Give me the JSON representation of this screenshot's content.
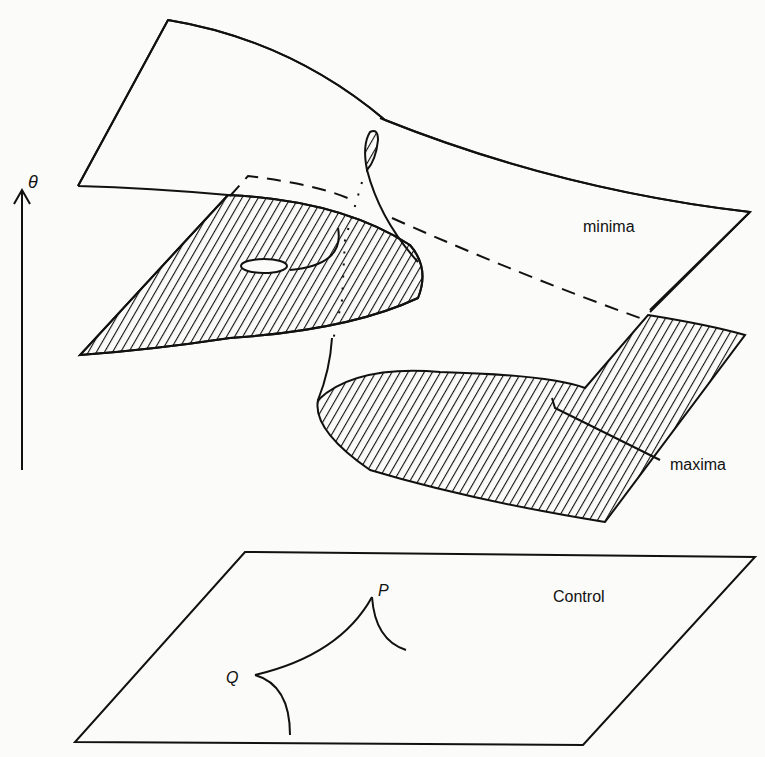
{
  "diagram": {
    "type": "cusp-catastrophe-surface",
    "labels": {
      "axis": "θ",
      "upper_sheet": "minima",
      "lower_sheet": "maxima",
      "control_plane": "Control",
      "cusp_point_p": "P",
      "cusp_point_q": "Q"
    },
    "colors": {
      "ink": "#111111",
      "paper": "#fbfbf9"
    }
  }
}
